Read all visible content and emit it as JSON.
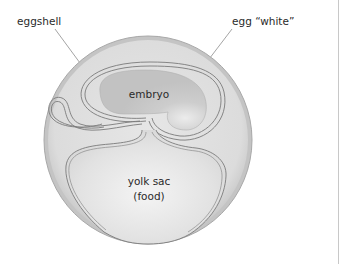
{
  "diagram": {
    "labels": {
      "eggshell": "eggshell",
      "egg_white": "egg “white”",
      "embryo": "embryo",
      "yolk_sac_line1": "yolk sac",
      "yolk_sac_line2": "(food)"
    },
    "colors": {
      "shell_outer": "#bdbdbd",
      "egg_white_fill": "#dedede",
      "membrane_stroke": "#7a7a7a",
      "embryo_fill": "#c9c9c9",
      "yolk_fill": "#e6e6e6",
      "leader_line": "#9a9a9a",
      "text": "#2a2a2a"
    }
  }
}
